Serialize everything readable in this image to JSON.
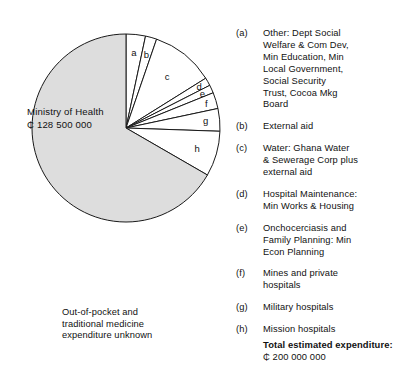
{
  "chart_data": {
    "type": "pie",
    "title": "",
    "center_label": {
      "name": "Ministry of Health",
      "amount": "₵ 128 500 000"
    },
    "note": "Out-of-pocket and\ntraditional medicine\nexpenditure unknown",
    "slices": [
      {
        "key": "a",
        "label": "a",
        "angle": 12,
        "percent": 3.3,
        "fill": "#ffffff",
        "legend": "Other:  Dept Social\nWelfare & Com Dev,\nMin Education, Min\nLocal Government,\nSocial Security\nTrust, Cocoa Mkg\nBoard"
      },
      {
        "key": "b",
        "label": "b",
        "angle": 7,
        "percent": 1.9,
        "fill": "#ffffff",
        "legend": "External aid"
      },
      {
        "key": "c",
        "label": "c",
        "angle": 39,
        "percent": 10.8,
        "fill": "#ffffff",
        "legend": "Water:  Ghana Water\n& Sewerage Corp plus\nexternal aid"
      },
      {
        "key": "d",
        "label": "d",
        "angle": 5,
        "percent": 1.4,
        "fill": "#ffffff",
        "legend": "Hospital Maintenance:\nMin Works & Housing"
      },
      {
        "key": "e",
        "label": "e",
        "angle": 5,
        "percent": 1.4,
        "fill": "#ffffff",
        "legend": "Onchocerciasis and\nFamily Planning: Min\nEcon Planning"
      },
      {
        "key": "f",
        "label": "f",
        "angle": 10,
        "percent": 2.8,
        "fill": "#ffffff",
        "legend": "Mines and private\nhospitals"
      },
      {
        "key": "g",
        "label": "g",
        "angle": 14,
        "percent": 3.9,
        "fill": "#ffffff",
        "legend": "Military hospitals"
      },
      {
        "key": "h",
        "label": "h",
        "angle": 28,
        "percent": 7.8,
        "fill": "#ffffff",
        "legend": "Mission hospitals"
      },
      {
        "key": "moh",
        "label": "",
        "angle": 240,
        "percent": 66.7,
        "fill": "#dddddd",
        "legend": ""
      }
    ],
    "legend_keys": [
      "(a)",
      "(b)",
      "(c)",
      "(d)",
      "(e)",
      "(f)",
      "(g)",
      "(h)"
    ],
    "total": {
      "label": "Total estimated expenditure:",
      "value": "₵ 200 000 000"
    },
    "colors": {
      "stroke": "#1a1a1a",
      "gray_fill": "#dddddd",
      "white_fill": "#ffffff",
      "text": "#111111"
    }
  },
  "legend": {
    "items": [
      {
        "key": "(a)",
        "text": "Other:  Dept Social\nWelfare & Com Dev,\nMin Education, Min\nLocal Government,\nSocial Security\nTrust, Cocoa Mkg\nBoard"
      },
      {
        "key": "(b)",
        "text": "External aid"
      },
      {
        "key": "(c)",
        "text": "Water:  Ghana Water\n& Sewerage Corp plus\nexternal aid"
      },
      {
        "key": "(d)",
        "text": "Hospital Maintenance:\nMin Works & Housing"
      },
      {
        "key": "(e)",
        "text": "Onchocerciasis and\nFamily Planning: Min\nEcon Planning"
      },
      {
        "key": "(f)",
        "text": "Mines and private\nhospitals"
      },
      {
        "key": "(g)",
        "text": "Military hospitals"
      },
      {
        "key": "(h)",
        "text": "Mission hospitals"
      }
    ]
  },
  "pie": {
    "center_name": "Ministry of Health",
    "center_amount": "₵ 128 500 000",
    "labels": {
      "a": "a",
      "b": "b",
      "c": "c",
      "d": "d",
      "e": "e",
      "f": "f",
      "g": "g",
      "h": "h"
    }
  },
  "footnote": {
    "line1": "Out-of-pocket and",
    "line2": "traditional medicine",
    "line3": "expenditure unknown"
  },
  "total": {
    "label": "Total estimated expenditure:",
    "value": "₵ 200 000 000"
  }
}
